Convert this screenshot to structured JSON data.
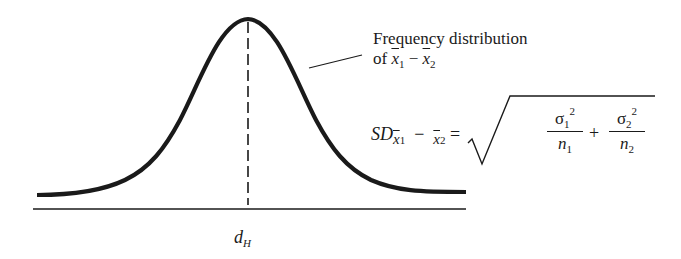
{
  "diagram": {
    "annotation": {
      "line1": "Frequency distribution",
      "line2_prefix": "of ",
      "x1": "x",
      "x1_sub": "1",
      "minus": "−",
      "x2": "x",
      "x2_sub": "2"
    },
    "formula": {
      "lhs": "SD",
      "lhs_x1": "x",
      "lhs_x1_sub": "1",
      "lhs_minus": "−",
      "lhs_x2": "x",
      "lhs_x2_sub": "2",
      "equals": "=",
      "term1_num": "σ",
      "term1_num_sub": "1",
      "term1_num_sup": "2",
      "term1_den": "n",
      "term1_den_sub": "1",
      "plus": "+",
      "term2_num": "σ",
      "term2_num_sub": "2",
      "term2_num_sup": "2",
      "term2_den": "n",
      "term2_den_sub": "2"
    },
    "axis_label": {
      "main": "d",
      "sub": "H"
    },
    "colors": {
      "ink": "#1a1a1a",
      "background": "#ffffff"
    }
  }
}
